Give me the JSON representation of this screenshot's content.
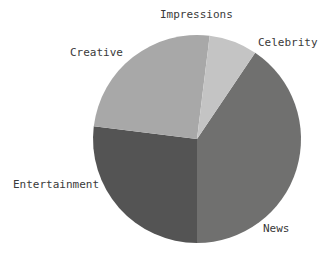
{
  "chart_data": {
    "type": "pie",
    "title": "Impressions",
    "xlabel": "",
    "ylabel": "",
    "categories": [
      "Celebrity",
      "News",
      "Entertainment",
      "Creative"
    ],
    "values": [
      40.5,
      27.0,
      25.0,
      7.5
    ],
    "unit": "%",
    "labels_position": "outside",
    "legend": "none",
    "grid": false,
    "start_angle_deg": -56,
    "direction": "clockwise",
    "geometry": {
      "center_x": 197,
      "center_y": 139,
      "radius": 104
    },
    "slices": [
      {
        "name": "Celebrity",
        "value": 40.5,
        "color": "#70706f",
        "start_deg": -56,
        "end_deg": 90,
        "label": "Celebrity"
      },
      {
        "name": "News",
        "value": 27.0,
        "color": "#545454",
        "start_deg": 90,
        "end_deg": 187,
        "label": "News"
      },
      {
        "name": "Entertainment",
        "value": 25.0,
        "color": "#a8a8a8",
        "start_deg": 187,
        "end_deg": 277,
        "label": "Entertainment"
      },
      {
        "name": "Creative",
        "value": 7.5,
        "color": "#c4c4c4",
        "start_deg": 277,
        "end_deg": 304,
        "label": "Creative"
      }
    ]
  },
  "chart": {
    "title": "Impressions",
    "labels": {
      "celebrity": "Celebrity",
      "news": "News",
      "entertainment": "Entertainment",
      "creative": "Creative"
    },
    "colors": {
      "celebrity": "#70706f",
      "news": "#545454",
      "entertainment": "#a8a8a8",
      "creative": "#c4c4c4",
      "background": "#ffffff",
      "text": "#3a3a3a"
    }
  }
}
